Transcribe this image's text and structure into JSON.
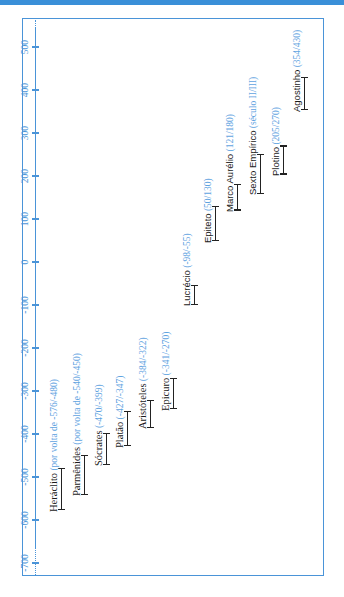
{
  "chart_data": {
    "type": "timeline",
    "title": "",
    "orientation": "vertical axis, years increasing upward; labels rotated 90° counter-clockwise",
    "axis": {
      "label": "",
      "ticks": [
        -700,
        -600,
        -500,
        -400,
        -300,
        -200,
        -100,
        0,
        100,
        200,
        300,
        400,
        500
      ],
      "tick_labels": [
        "-700",
        "-600",
        "-500",
        "-400",
        "-300",
        "-200",
        "-100",
        "0",
        "100",
        "200",
        "300",
        "400",
        "500"
      ],
      "range": [
        -700,
        500
      ]
    },
    "entries": [
      {
        "name": "Heráclito",
        "dates_label": "(por volta de -576/-480)",
        "start": -576,
        "end": -480
      },
      {
        "name": "Parmênides",
        "dates_label": "(por volta de -540/-450)",
        "start": -540,
        "end": -450
      },
      {
        "name": "Sócrates",
        "dates_label": "(-470/-399)",
        "start": -470,
        "end": -399
      },
      {
        "name": "Platão",
        "dates_label": "(-427/-347)",
        "start": -427,
        "end": -347
      },
      {
        "name": "Aristóteles",
        "dates_label": "(-384/-322)",
        "start": -384,
        "end": -322
      },
      {
        "name": "Epicuro",
        "dates_label": "(-341/-270)",
        "start": -341,
        "end": -270
      },
      {
        "name": "Lucrécio",
        "dates_label": "(-98/-55)",
        "start": -98,
        "end": -55
      },
      {
        "name": "Epiteto",
        "dates_label": "(50/130)",
        "start": 50,
        "end": 130
      },
      {
        "name": "Marco Aurélio",
        "dates_label": "(121/180)",
        "start": 121,
        "end": 180
      },
      {
        "name": "Sexto Empírico",
        "dates_label": "(século II/III)",
        "start": 160,
        "end": 250
      },
      {
        "name": "Plotino",
        "dates_label": "(205/270)",
        "start": 205,
        "end": 270
      },
      {
        "name": "Agostinho",
        "dates_label": "(354/430)",
        "start": 354,
        "end": 430
      }
    ],
    "colors": {
      "axis": "#4a94d8",
      "dates": "#5fa3df",
      "bars": "#222222",
      "frame": "#4a94d8",
      "top_band": "#3a8fd8"
    }
  }
}
